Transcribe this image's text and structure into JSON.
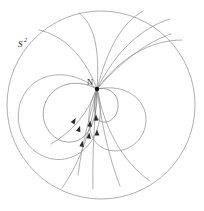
{
  "figure": {
    "kind": "vector-field-on-sphere-diagram",
    "background_color": "#ffffff",
    "curve_color": "#8e8e8e",
    "boundary_color": "#9a9a9a",
    "arrow_color": "#2a2a2a",
    "point_color": "#111111",
    "labels": {
      "sphere": "S",
      "sphere_exponent": "2",
      "node": "N"
    },
    "boundary": {
      "name": "S2",
      "cx": 101,
      "cy": 105,
      "r": 94
    },
    "singular_point": {
      "name": "N",
      "x": 97,
      "y": 89,
      "r": 2.2
    },
    "label_positions": {
      "sphere_x": 18,
      "sphere_y": 47,
      "sphere_sup_x": 24,
      "sphere_sup_y": 43,
      "node_x": 89,
      "node_y": 84
    },
    "arrows": [
      {
        "x": 74,
        "y": 121,
        "angle": 212
      },
      {
        "x": 79,
        "y": 129,
        "angle": 198
      },
      {
        "x": 82,
        "y": 144,
        "angle": 188
      },
      {
        "x": 89,
        "y": 136,
        "angle": 186
      },
      {
        "x": 90,
        "y": 124,
        "angle": 185
      },
      {
        "x": 96,
        "y": 118,
        "angle": 178
      },
      {
        "x": 97,
        "y": 133,
        "angle": 180
      }
    ],
    "curves": {
      "left_lobe": "M97,89 C74,76 49,86 44,107 C39,128 58,147 76,141 C92,136 98,113 97,89 Z",
      "right_lobe": "M97,89 C110,86 119,95 118,107 C117,119 106,126 99,120 C93,115 93,99 97,89 Z",
      "mid_lobe": "M97,89 C125,83 147,99 146,121 C145,145 119,158 101,147 C85,137 86,106 97,89 Z",
      "outer_left_lobe": "M97,89 C63,62 25,76 19,108 C13,142 44,168 72,157 C97,147 106,116 97,89 Z",
      "fan": [
        "M97,89 C118,65 144,43 171,34",
        "M97,89 C120,58 150,40 182,40",
        "M97,89 C116,51 141,28 170,19",
        "M97,89 C108,47 122,23 143,11",
        "M97,89 C100,48 94,24 79,13",
        "M97,89 C84,54 62,35 39,30"
      ],
      "descending": [
        "M97,89 C90,115 82,144 78,175",
        "M97,89 C95,118 92,152 93,189",
        "M97,89 C101,120 108,155 120,186",
        "M97,89 C88,112 74,131 51,144",
        "M97,89 C93,123 82,160 62,188",
        "M97,89 C104,126 121,161 150,181"
      ]
    }
  }
}
